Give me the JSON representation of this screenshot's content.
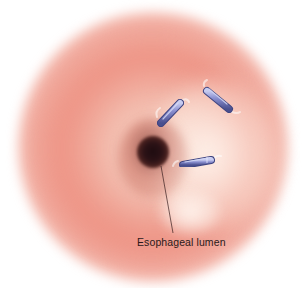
{
  "illustration": {
    "subject": "Endoscopic view of esophagus with clips",
    "labels": {
      "lumen": "Esophageal lumen"
    },
    "clips": [
      {
        "name": "clip-upper-left",
        "x1": 161,
        "y1": 123,
        "x2": 180,
        "y2": 103
      },
      {
        "name": "clip-upper-right",
        "x1": 207,
        "y1": 91,
        "x2": 229,
        "y2": 109
      },
      {
        "name": "clip-lower",
        "x1": 183,
        "y1": 165,
        "x2": 211,
        "y2": 160
      }
    ],
    "colors": {
      "tissue_light": "#f8d8cc",
      "tissue_mid": "#ee968a",
      "lumen_dark": "#1e0c10",
      "clip_body": "#7a7fc4",
      "clip_edge": "#4a4f8e",
      "clip_highlight": "#c8ccf0",
      "label_text": "#2a1a1a",
      "leader_line": "#3a2020"
    }
  }
}
